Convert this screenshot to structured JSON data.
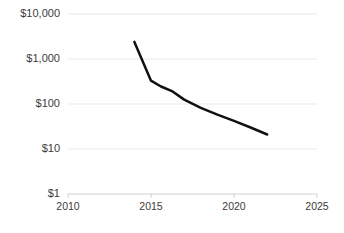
{
  "chart_data": {
    "type": "line",
    "title": "",
    "subtitle": "",
    "xlabel": "",
    "ylabel": "",
    "yscale": "log",
    "xscale": "linear",
    "xlim": [
      2010,
      2025
    ],
    "ylim": [
      1,
      10000
    ],
    "grid": true,
    "legend": false,
    "legend_position": "none",
    "ytick_labels": [
      "$10,000",
      "$1,000",
      "$100",
      "$10",
      "$1"
    ],
    "ytick_values": [
      10000,
      1000,
      100,
      10,
      1
    ],
    "xtick_labels": [
      "2010",
      "2015",
      "2020",
      "2025"
    ],
    "xtick_values": [
      2010,
      2015,
      2020,
      2025
    ],
    "series": [
      {
        "name": "cost",
        "color": "#111111",
        "linewidth": 2.5,
        "x": [
          2014.0,
          2015.0,
          2015.6,
          2016.3,
          2017.0,
          2018.0,
          2019.0,
          2020.0,
          2021.0,
          2022.0
        ],
        "values": [
          2400,
          330,
          245,
          190,
          125,
          82,
          58,
          42,
          30,
          21
        ]
      }
    ]
  },
  "axis": {
    "y_labels": [
      {
        "text": "$10,000",
        "value": 10000
      },
      {
        "text": "$1,000",
        "value": 1000
      },
      {
        "text": "$100",
        "value": 100
      },
      {
        "text": "$10",
        "value": 10
      },
      {
        "text": "$1",
        "value": 1
      }
    ],
    "x_labels": [
      {
        "text": "2010",
        "value": 2010
      },
      {
        "text": "2015",
        "value": 2015
      },
      {
        "text": "2020",
        "value": 2020
      },
      {
        "text": "2025",
        "value": 2025
      }
    ]
  },
  "style": {
    "gridline_color": "#e9e9e9",
    "axis_color": "#d0d0d0",
    "line_color": "#111111",
    "text_color": "#3b3b3b",
    "background": "#ffffff"
  }
}
